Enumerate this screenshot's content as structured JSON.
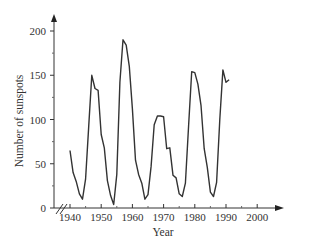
{
  "chart_data": {
    "type": "line",
    "title": "",
    "xlabel": "Year",
    "ylabel": "Number of sunspots",
    "xlim": [
      1940,
      2000
    ],
    "ylim": [
      0,
      200
    ],
    "x_ticks": [
      1940,
      1950,
      1960,
      1970,
      1980,
      1990,
      2000
    ],
    "y_ticks": [
      0,
      50,
      100,
      150,
      200
    ],
    "x_tick_labels": [
      "1940",
      "1950",
      "1960",
      "1970",
      "1980",
      "1990",
      "2000"
    ],
    "y_tick_labels": [
      "0",
      "50",
      "100",
      "150",
      "200"
    ],
    "axis_break": true,
    "grid": false,
    "legend": null,
    "series": [
      {
        "name": "Sunspots",
        "x": [
          1940,
          1941,
          1942,
          1943,
          1944,
          1945,
          1946,
          1947,
          1948,
          1949,
          1950,
          1951,
          1952,
          1953,
          1954,
          1955,
          1956,
          1957,
          1958,
          1959,
          1960,
          1961,
          1962,
          1963,
          1964,
          1965,
          1966,
          1967,
          1968,
          1969,
          1970,
          1971,
          1972,
          1973,
          1974,
          1975,
          1976,
          1977,
          1978,
          1979,
          1980,
          1981,
          1982,
          1983,
          1984,
          1985,
          1986,
          1987,
          1988,
          1989,
          1990,
          1991
        ],
        "values": [
          65,
          40,
          30,
          16,
          10,
          33,
          92,
          150,
          135,
          133,
          83,
          68,
          31,
          14,
          4,
          38,
          142,
          190,
          184,
          160,
          112,
          54,
          38,
          28,
          10,
          15,
          47,
          94,
          104,
          104,
          103,
          67,
          68,
          37,
          34,
          16,
          13,
          28,
          93,
          154,
          153,
          140,
          116,
          67,
          46,
          18,
          13,
          29,
          100,
          156,
          142,
          145
        ]
      }
    ]
  }
}
